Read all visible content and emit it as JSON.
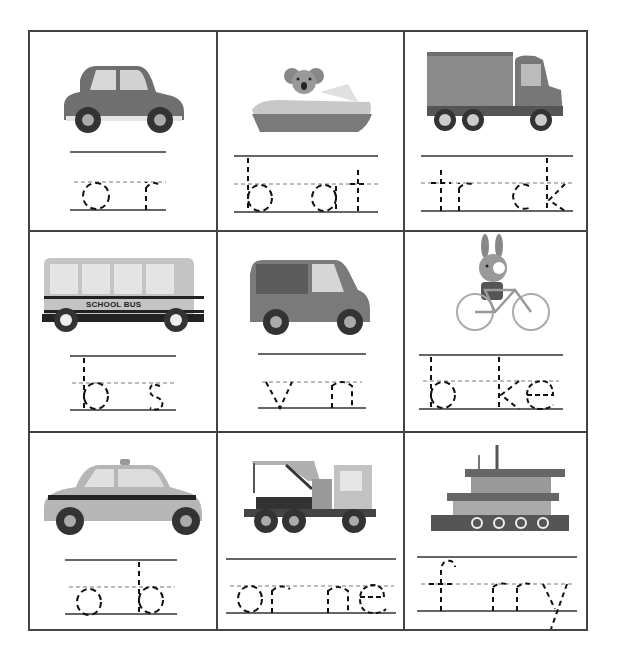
{
  "worksheet": {
    "title": "Transportation Missing Vowels",
    "instructions_visible": false,
    "cells": [
      {
        "id": "car",
        "picture": "car-icon",
        "word": "car",
        "traced": "c r",
        "missing": "a",
        "letters": [
          "c",
          "",
          "r"
        ]
      },
      {
        "id": "boat",
        "picture": "boat-icon",
        "word": "boat",
        "traced": "b at",
        "missing": "o",
        "letters": [
          "b",
          "",
          "a",
          "t"
        ]
      },
      {
        "id": "truck",
        "picture": "truck-icon",
        "word": "truck",
        "traced": "tr ck",
        "missing": "u",
        "letters": [
          "t",
          "r",
          "",
          "c",
          "k"
        ]
      },
      {
        "id": "bus",
        "picture": "school-bus-icon",
        "word": "bus",
        "traced": "b s",
        "missing": "u",
        "letters": [
          "b",
          "",
          "s"
        ],
        "picture_label": "SCHOOL BUS"
      },
      {
        "id": "van",
        "picture": "van-icon",
        "word": "van",
        "traced": "v n",
        "missing": "a",
        "letters": [
          "v",
          "",
          "n"
        ]
      },
      {
        "id": "bike",
        "picture": "bike-icon",
        "word": "bike",
        "traced": "b ke",
        "missing": "i",
        "letters": [
          "b",
          "",
          "k",
          "e"
        ]
      },
      {
        "id": "cab",
        "picture": "taxi-icon",
        "word": "cab",
        "traced": "c b",
        "missing": "a",
        "letters": [
          "c",
          "",
          "b"
        ]
      },
      {
        "id": "crane",
        "picture": "crane-truck-icon",
        "word": "crane",
        "traced": "cr ne",
        "missing": "a",
        "letters": [
          "c",
          "r",
          "",
          "n",
          "e"
        ]
      },
      {
        "id": "ferry",
        "picture": "ferry-icon",
        "word": "ferry",
        "traced": "f rry",
        "missing": "e",
        "letters": [
          "f",
          "",
          "r",
          "r",
          "y"
        ]
      }
    ]
  },
  "colors": {
    "border": "#444444",
    "line": "#333333",
    "dash": "#111111",
    "midline": "#777777"
  }
}
